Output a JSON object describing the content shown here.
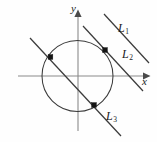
{
  "figure": {
    "background_color": "#fefefe",
    "width": 157,
    "height": 142
  },
  "axes": {
    "x_label": "x",
    "y_label": "y",
    "origin": {
      "x": 78,
      "y": 76
    },
    "x_axis": {
      "x1": 18,
      "y1": 76,
      "x2": 146,
      "y2": 76,
      "arrow": "right",
      "color": "#8a8a8a"
    },
    "y_axis": {
      "x1": 78,
      "y1": 130,
      "x2": 78,
      "y2": 14,
      "arrow": "up",
      "color": "#8a8a8a"
    }
  },
  "circle": {
    "center_x": 77.5,
    "center_y": 76,
    "radius": 35.5,
    "color": "#3b3b3b"
  },
  "lines": [
    {
      "label": "L",
      "subscript": "1",
      "role": "non-intersecting",
      "x1": 104,
      "y1": 14,
      "x2": 149,
      "y2": 63,
      "color": "#3b3b3b"
    },
    {
      "label": "L",
      "subscript": "2",
      "role": "tangent",
      "x1": 83,
      "y1": 26,
      "x2": 143,
      "y2": 91,
      "color": "#3b3b3b"
    },
    {
      "label": "L",
      "subscript": "3",
      "role": "secant",
      "x1": 30,
      "y1": 38,
      "x2": 121,
      "y2": 136,
      "color": "#3b3b3b"
    }
  ],
  "markers": [
    {
      "name": "tangency-point",
      "x": 105,
      "y": 50,
      "size": 4.6,
      "color": "#141414"
    },
    {
      "name": "secant-entry-point",
      "x": 50.5,
      "y": 57,
      "size": 4.6,
      "color": "#141414"
    },
    {
      "name": "secant-exit-point",
      "x": 94,
      "y": 105,
      "size": 4.6,
      "color": "#141414"
    }
  ]
}
